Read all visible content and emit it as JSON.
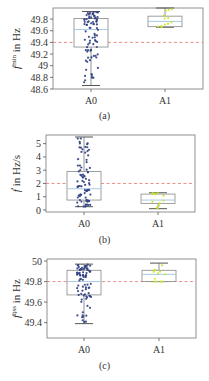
{
  "chart_data": [
    {
      "type": "box",
      "panel_label": "(a)",
      "ylabel_base": "f",
      "ylabel_sup": "min",
      "ylabel_unit": " in Hz",
      "categories": [
        "A0",
        "A1"
      ],
      "ylim": [
        48.6,
        49.99
      ],
      "yticks": [
        48.6,
        48.8,
        49,
        49.2,
        49.4,
        49.6,
        49.8
      ],
      "ytick_labels": [
        "48.6",
        "48.8",
        "49",
        "49.2",
        "49.4",
        "49.6",
        "49.8"
      ],
      "threshold": 49.4,
      "series": [
        {
          "name": "A0",
          "color": "#2e3f7f",
          "min": 48.66,
          "q1": 49.32,
          "median": 49.62,
          "q3": 49.81,
          "max": 49.93,
          "n_points": 80
        },
        {
          "name": "A1",
          "color": "#c8e61e",
          "min": 49.66,
          "q1": 49.67,
          "median": 49.76,
          "q3": 49.85,
          "max": 49.99,
          "n_points": 12
        }
      ],
      "frame": {
        "x0": 53,
        "x1": 203,
        "y0": 8,
        "y1": 89
      },
      "cat_x": [
        91,
        165
      ],
      "grid": false,
      "legend": "none"
    },
    {
      "type": "box",
      "panel_label": "(b)",
      "ylabel_base": "ḟ",
      "ylabel_sup": "",
      "ylabel_unit": " in Hz/s",
      "categories": [
        "A0",
        "A1"
      ],
      "ylim": [
        -0.15,
        5.65
      ],
      "yticks": [
        0,
        1,
        2,
        3,
        4,
        5
      ],
      "ytick_labels": [
        "0",
        "1",
        "2",
        "3",
        "4",
        "5"
      ],
      "threshold": 2,
      "series": [
        {
          "name": "A0",
          "color": "#2e3f7f",
          "min": 0.25,
          "q1": 0.75,
          "median": 1.6,
          "q3": 2.9,
          "max": 5.5,
          "n_points": 80
        },
        {
          "name": "A1",
          "color": "#c8e61e",
          "min": 0.1,
          "q1": 0.5,
          "median": 0.75,
          "q3": 1.2,
          "max": 1.3,
          "n_points": 12
        }
      ],
      "frame": {
        "x0": 46,
        "x1": 195,
        "y0": 135,
        "y1": 212
      },
      "cat_x": [
        84,
        158
      ],
      "grid": false,
      "legend": "none"
    },
    {
      "type": "box",
      "panel_label": "(c)",
      "ylabel_base": "f",
      "ylabel_sup": "qss",
      "ylabel_unit": " in Hz",
      "categories": [
        "A0",
        "A1"
      ],
      "ylim": [
        49.25,
        50.02
      ],
      "yticks": [
        49.4,
        49.6,
        49.8,
        50
      ],
      "ytick_labels": [
        "49.4",
        "49.6",
        "49.8",
        "50"
      ],
      "threshold": 49.8,
      "series": [
        {
          "name": "A0",
          "color": "#2e3f7f",
          "min": 49.39,
          "q1": 49.67,
          "median": 49.8,
          "q3": 49.91,
          "max": 49.97,
          "n_points": 80
        },
        {
          "name": "A1",
          "color": "#c8e61e",
          "min": 49.8,
          "q1": 49.8,
          "median": 49.87,
          "q3": 49.91,
          "max": 49.98,
          "n_points": 12
        }
      ],
      "frame": {
        "x0": 47,
        "x1": 196,
        "y0": 259,
        "y1": 338
      },
      "cat_x": [
        84,
        159
      ],
      "grid": false,
      "legend": "none"
    }
  ],
  "captions": [
    "(a)",
    "(b)",
    "(c)"
  ],
  "colors": {
    "threshold": "#e8837a",
    "median": "#9fc3e0",
    "box": "#888888",
    "axis": "#555555"
  }
}
